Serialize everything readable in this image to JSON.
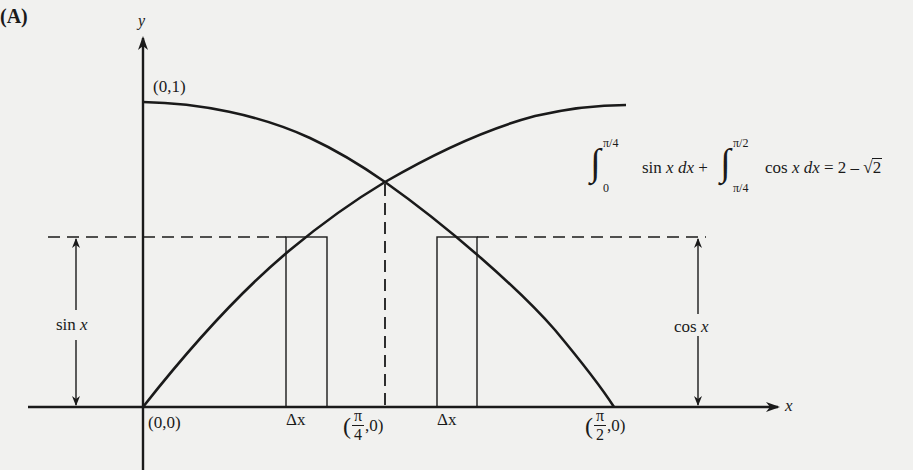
{
  "panel_label": "(A)",
  "axes": {
    "x_label": "x",
    "y_label": "y"
  },
  "points": {
    "origin": "(0,0)",
    "y_intercept": "(0,1)",
    "pi_over_4": {
      "open": "(",
      "num": "π",
      "den": "4",
      "close": ",0)"
    },
    "pi_over_2": {
      "open": "(",
      "num": "π",
      "den": "2",
      "close": ",0)"
    }
  },
  "curves": [
    {
      "name": "sin x",
      "from": "(0,0)",
      "to": "(π/2,1)"
    },
    {
      "name": "cos x",
      "from": "(0,1)",
      "to": "(π/2,0)"
    }
  ],
  "strips": [
    {
      "label": "Δx",
      "side": "left"
    },
    {
      "label": "Δx",
      "side": "right"
    }
  ],
  "height_markers": {
    "left": {
      "fn": "sin",
      "var": "x"
    },
    "right": {
      "fn": "cos",
      "var": "x"
    }
  },
  "formula": {
    "int1_upper": "π/4",
    "int1_lower": "0",
    "int1_body": "sin",
    "int1_var": "x",
    "int1_d": "dx",
    "plus": "+",
    "int2_upper": "π/2",
    "int2_lower": "π/4",
    "int2_body": "cos",
    "int2_var": "x",
    "int2_d": "dx",
    "equals": "= 2 –",
    "sqrt_arg": "2"
  },
  "colors": {
    "ink": "#1a1a1a",
    "paper": "#f1f1ef"
  }
}
